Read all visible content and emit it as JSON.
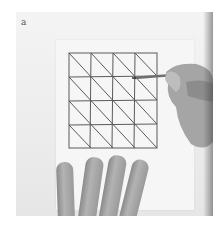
{
  "figure": {
    "panel_label": "a",
    "grid": {
      "rows": 4,
      "cols": 4,
      "diagonal_direction": "top-left to bottom-right"
    },
    "colors": {
      "background": "#ffffff",
      "paper": "#f4f4f4",
      "line": "#555555",
      "skin": "#a0a0a0"
    }
  }
}
